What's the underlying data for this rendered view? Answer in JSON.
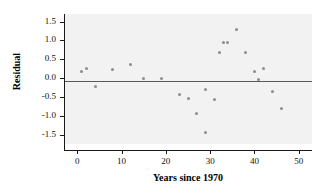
{
  "chart_data": {
    "type": "scatter",
    "title": "",
    "xlabel": "Years since 1970",
    "ylabel": "Residual",
    "xlim": [
      -3,
      53
    ],
    "ylim": [
      -1.75,
      1.7
    ],
    "xticks": [
      0,
      10,
      20,
      30,
      40,
      50
    ],
    "xtick_labels": [
      "0",
      "10",
      "20",
      "30",
      "40",
      "50"
    ],
    "yticks": [
      1.5,
      1.0,
      0.5,
      0.0,
      -0.5,
      -1.0,
      -1.5
    ],
    "ytick_labels": [
      "1.5",
      "1.0",
      "0.5",
      "0.0",
      "-0.5",
      "-1.0",
      "-1.5"
    ],
    "grid": false,
    "legend": null,
    "reference_lines": [
      {
        "orientation": "horizontal",
        "value": 0.0,
        "color": "#5a5a5a"
      }
    ],
    "marker_color": "#8c8c8c",
    "plot_background": "#f2f2f2",
    "points": [
      {
        "x": 1,
        "y": 0.17
      },
      {
        "x": 2,
        "y": 0.26
      },
      {
        "x": 4,
        "y": -0.22
      },
      {
        "x": 8,
        "y": 0.23
      },
      {
        "x": 12,
        "y": 0.35
      },
      {
        "x": 15,
        "y": -0.01
      },
      {
        "x": 19,
        "y": -0.01
      },
      {
        "x": 23,
        "y": -0.43
      },
      {
        "x": 25,
        "y": -0.55
      },
      {
        "x": 27,
        "y": -0.95
      },
      {
        "x": 29,
        "y": -1.44
      },
      {
        "x": 29,
        "y": -0.3
      },
      {
        "x": 31,
        "y": -0.57
      },
      {
        "x": 32,
        "y": 0.67
      },
      {
        "x": 33,
        "y": 0.94
      },
      {
        "x": 34,
        "y": 0.94
      },
      {
        "x": 36,
        "y": 1.3
      },
      {
        "x": 38,
        "y": 0.68
      },
      {
        "x": 40,
        "y": 0.17
      },
      {
        "x": 41,
        "y": -0.05
      },
      {
        "x": 42,
        "y": 0.25
      },
      {
        "x": 44,
        "y": -0.36
      },
      {
        "x": 46,
        "y": -0.81
      }
    ]
  }
}
